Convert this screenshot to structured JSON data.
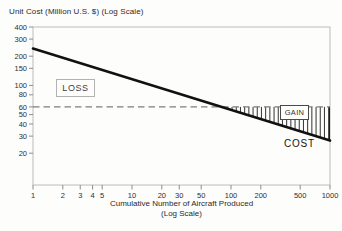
{
  "title": "Unit Cost (Million U.S. $) (Log Scale)",
  "x_axis_label_line1": "Cumulative Number of Aircraft Produced",
  "x_axis_label_line2": "(Log Scale)",
  "region_labels": {
    "loss": "LOSS",
    "gain": "GAIN",
    "cost": "COST"
  },
  "colors": {
    "cost_line": "#111111",
    "price_dashed_line": "#7d7d7d",
    "hatch": "#1c1c1c",
    "frame": "#bcbcbc",
    "tick": "#8c8c8c",
    "tick_text": "#2e2e2e",
    "background": "#fdfdfc"
  },
  "chart_data": {
    "type": "line",
    "title": "Unit Cost (Million U.S. $) (Log Scale)",
    "xlabel": "Cumulative Number of Aircraft Produced (Log Scale)",
    "ylabel": "Unit Cost (Million U.S. $) (Log Scale)",
    "x_scale": "log",
    "y_scale": "log",
    "xlim": [
      1,
      1000
    ],
    "ylim": [
      9.5,
      400
    ],
    "x_ticks": [
      1,
      2,
      3,
      4,
      5,
      10,
      20,
      30,
      50,
      100,
      200,
      500,
      1000
    ],
    "y_ticks": [
      400,
      300,
      200,
      150,
      100,
      80,
      60,
      50,
      40,
      30,
      20
    ],
    "grid": false,
    "legend": false,
    "series": [
      {
        "name": "COST",
        "style": "solid-bold",
        "x": [
          1,
          1000
        ],
        "y": [
          240,
          27
        ]
      },
      {
        "name": "PRICE",
        "style": "dashed",
        "x": [
          1,
          1000
        ],
        "y": [
          60,
          60
        ]
      }
    ],
    "break_even_units_approx": 80,
    "regions": [
      {
        "label": "LOSS",
        "description": "unit cost above price, low cumulative volume"
      },
      {
        "label": "GAIN",
        "description": "price above unit cost beyond break-even",
        "hatch": "vertical"
      },
      {
        "label": "COST",
        "description": "label of the learning-curve cost line"
      }
    ]
  }
}
